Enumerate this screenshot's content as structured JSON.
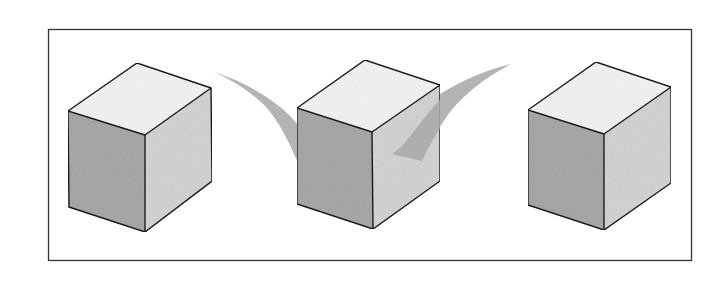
{
  "figure": {
    "frame": {
      "x": 48,
      "y": 29,
      "width": 644,
      "height": 232,
      "stroke": "#333333"
    },
    "colors": {
      "top_face": "#f4f4f4",
      "left_face": "#a9a9a9",
      "right_face": "#d4d4d4",
      "edge": "#1e1e1e",
      "arrow": "#b4b4b4"
    },
    "cubes": [
      {
        "id": "cube-left",
        "top": [
          137,
          63
        ],
        "right_top": [
          211,
          88
        ],
        "front_top": [
          145,
          135
        ],
        "left_top": [
          68,
          111
        ],
        "left_bottom": [
          69,
          207
        ],
        "front_bottom": [
          145,
          232
        ],
        "right_bottom": [
          212,
          181
        ]
      },
      {
        "id": "cube-middle",
        "top": [
          365,
          60
        ],
        "right_top": [
          440,
          85
        ],
        "front_top": [
          372,
          132
        ],
        "left_top": [
          297,
          108
        ],
        "left_bottom": [
          297,
          204
        ],
        "front_bottom": [
          373,
          229
        ],
        "right_bottom": [
          440,
          181
        ]
      },
      {
        "id": "cube-right",
        "top": [
          596,
          62
        ],
        "right_top": [
          671,
          87
        ],
        "front_top": [
          604,
          134
        ],
        "left_top": [
          528,
          110
        ],
        "left_bottom": [
          528,
          205
        ],
        "front_bottom": [
          604,
          230
        ],
        "right_bottom": [
          671,
          183
        ]
      }
    ],
    "arrows": [
      {
        "id": "arrow-left-swoosh",
        "direction": "from left cube toward middle cube"
      },
      {
        "id": "arrow-right-swoosh",
        "direction": "from right area toward middle cube"
      }
    ]
  }
}
